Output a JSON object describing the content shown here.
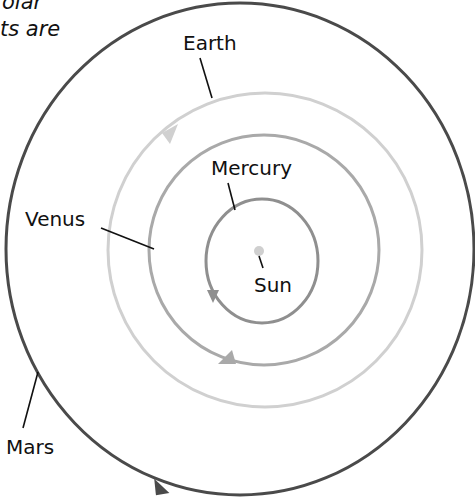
{
  "caption_fragment": {
    "line1": "olar",
    "line2": "ts are"
  },
  "diagram": {
    "type": "solar-system-orbits",
    "center_body": {
      "name": "Sun",
      "label": "Sun",
      "color": "#c8c8c8"
    },
    "orbits": [
      {
        "name": "Mercury",
        "label": "Mercury",
        "color": "#8f8f8f",
        "r": 58
      },
      {
        "name": "Venus",
        "label": "Venus",
        "color": "#a9a9a9",
        "r": 115
      },
      {
        "name": "Earth",
        "label": "Earth",
        "color": "#cfcfcf",
        "r": 157
      },
      {
        "name": "Mars",
        "label": "Mars",
        "color": "#4a4a4a",
        "r": 240
      }
    ],
    "direction": "counter-clockwise"
  }
}
